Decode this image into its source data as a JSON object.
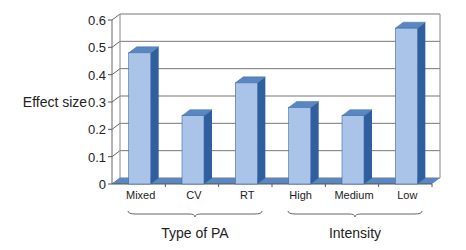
{
  "chart_data": {
    "type": "bar",
    "title": "",
    "xlabel": "",
    "ylabel": "Effect size",
    "ylim": [
      0,
      0.6
    ],
    "yticks": [
      0,
      0.1,
      0.2,
      0.3,
      0.4,
      0.5,
      0.6
    ],
    "ytick_labels": [
      "0",
      "0.1",
      "0.2",
      "0.3",
      "0.4",
      "0.5",
      "0.6"
    ],
    "categories": [
      "Mixed",
      "CV",
      "RT",
      "High",
      "Medium",
      "Low"
    ],
    "values": [
      0.48,
      0.25,
      0.37,
      0.28,
      0.25,
      0.57
    ],
    "groups": [
      {
        "label": "Type of PA",
        "categories": [
          "Mixed",
          "CV",
          "RT"
        ]
      },
      {
        "label": "Intensity",
        "categories": [
          "High",
          "Medium",
          "Low"
        ]
      }
    ],
    "grid": true,
    "style": "3d-column",
    "colors": {
      "bar_front": "#a9c4e8",
      "bar_side": "#2f5f9e",
      "bar_top": "#5b87c0",
      "floor": "#5b87c0",
      "grid": "#666666"
    }
  }
}
